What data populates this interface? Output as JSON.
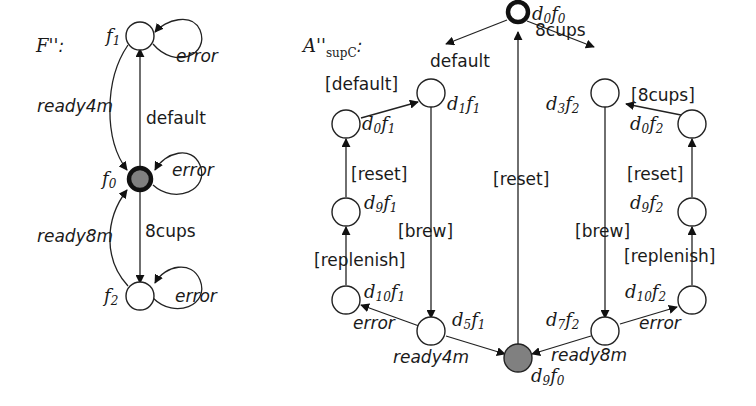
{
  "diagram_left": {
    "title": "F''",
    "title_suffix": ":",
    "states": [
      {
        "id": "f1",
        "label": "f",
        "sub": "1",
        "type": "normal"
      },
      {
        "id": "f0",
        "label": "f",
        "sub": "0",
        "type": "initial-marked"
      },
      {
        "id": "f2",
        "label": "f",
        "sub": "2",
        "type": "normal"
      }
    ],
    "transitions": [
      {
        "from": "f1",
        "to": "f1",
        "label": "error"
      },
      {
        "from": "f0",
        "to": "f1",
        "label": "default"
      },
      {
        "from": "f1",
        "to": "f0",
        "label": "ready4m"
      },
      {
        "from": "f0",
        "to": "f0",
        "label": "error"
      },
      {
        "from": "f0",
        "to": "f2",
        "label": "8cups"
      },
      {
        "from": "f2",
        "to": "f0",
        "label": "ready8m"
      },
      {
        "from": "f2",
        "to": "f2",
        "label": "error"
      }
    ]
  },
  "diagram_right": {
    "title": "A''",
    "title_sub": "supC",
    "title_suffix": ":",
    "states": [
      {
        "id": "d0f0",
        "d": "0",
        "f": "0",
        "type": "initial"
      },
      {
        "id": "d1f1",
        "d": "1",
        "f": "1",
        "type": "normal"
      },
      {
        "id": "d0f1",
        "d": "0",
        "f": "1",
        "type": "normal"
      },
      {
        "id": "d9f1",
        "d": "9",
        "f": "1",
        "type": "normal"
      },
      {
        "id": "d10f1",
        "d": "10",
        "f": "1",
        "type": "normal"
      },
      {
        "id": "d5f1",
        "d": "5",
        "f": "1",
        "type": "normal"
      },
      {
        "id": "d9f0",
        "d": "9",
        "f": "0",
        "type": "marked"
      },
      {
        "id": "d7f2",
        "d": "7",
        "f": "2",
        "type": "normal"
      },
      {
        "id": "d10f2",
        "d": "10",
        "f": "2",
        "type": "normal"
      },
      {
        "id": "d9f2",
        "d": "9",
        "f": "2",
        "type": "normal"
      },
      {
        "id": "d0f2",
        "d": "0",
        "f": "2",
        "type": "normal"
      },
      {
        "id": "d3f2",
        "d": "3",
        "f": "2",
        "type": "normal"
      }
    ],
    "transitions": [
      {
        "from": "d0f0",
        "to": "d1f1",
        "label": "default"
      },
      {
        "from": "d0f0",
        "to": "d3f2",
        "label": "8cups"
      },
      {
        "from": "d0f1",
        "to": "d1f1",
        "label": "[default]"
      },
      {
        "from": "d9f1",
        "to": "d0f1",
        "label": "[reset]"
      },
      {
        "from": "d10f1",
        "to": "d9f1",
        "label": "[replenish]"
      },
      {
        "from": "d1f1",
        "to": "d5f1",
        "label": "[brew]"
      },
      {
        "from": "d5f1",
        "to": "d10f1",
        "label": "error"
      },
      {
        "from": "d5f1",
        "to": "d9f0",
        "label": "ready4m"
      },
      {
        "from": "d9f0",
        "to": "d0f0",
        "label": "[reset]"
      },
      {
        "from": "d3f2",
        "to": "d7f2",
        "label": "[brew]"
      },
      {
        "from": "d7f2",
        "to": "d9f0",
        "label": "ready8m"
      },
      {
        "from": "d7f2",
        "to": "d10f2",
        "label": "error"
      },
      {
        "from": "d10f2",
        "to": "d9f2",
        "label": "[replenish]"
      },
      {
        "from": "d9f2",
        "to": "d0f2",
        "label": "[reset]"
      },
      {
        "from": "d0f2",
        "to": "d3f2",
        "label": "[8cups]"
      }
    ]
  },
  "labels": {
    "L_title": "F''",
    "L_colon": ":",
    "L_f1": "f",
    "L_f1s": "1",
    "L_f0": "f",
    "L_f0s": "0",
    "L_f2": "f",
    "L_f2s": "2",
    "L_err1": "error",
    "L_err0": "error",
    "L_err2": "error",
    "L_default": "default",
    "L_ready4m": "ready4m",
    "L_8cups": "8cups",
    "L_ready8m": "ready8m",
    "R_title": "A''",
    "R_titlesub": "supC",
    "R_colon": ":",
    "R_default": "default",
    "R_8cups": "8cups",
    "R_bdefault": "[default]",
    "R_b8cups": "[8cups]",
    "R_reset_l": "[reset]",
    "R_reset_c": "[reset]",
    "R_reset_r": "[reset]",
    "R_brew_l": "[brew]",
    "R_brew_r": "[brew]",
    "R_replenish_l": "[replenish]",
    "R_replenish_r": "[replenish]",
    "R_error_l": "error",
    "R_error_r": "error",
    "R_ready4m": "ready4m",
    "R_ready8m": "ready8m",
    "d": "d",
    "f": "f",
    "n0": "0",
    "n1": "1",
    "n2": "2",
    "n3": "3",
    "n5": "5",
    "n7": "7",
    "n9": "9",
    "n10": "10"
  }
}
